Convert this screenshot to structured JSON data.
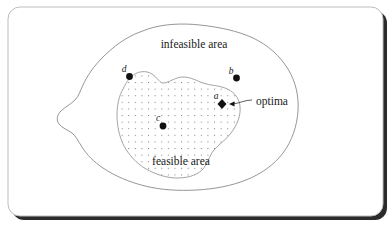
{
  "figure": {
    "background_color": "#ffffff",
    "frame": {
      "name": "rounded-card-frame",
      "border_color": "#bdbdbd",
      "shadow_color": "#2b2b2b"
    },
    "regions": [
      {
        "id": "infeasible",
        "label": "infeasible area",
        "label_x": 194,
        "label_y": 48,
        "fill": "#ffffff",
        "stroke": "#8a8a8a"
      },
      {
        "id": "feasible",
        "label": "feasible area",
        "label_x": 181,
        "label_y": 165,
        "fill": "dot-grid",
        "stroke": "#9a9a9a",
        "dot_color": "#777777",
        "dot_spacing": 6.6
      }
    ],
    "points": [
      {
        "id": "d",
        "label": "d",
        "x": 129.5,
        "y": 76.5,
        "marker": "circle",
        "label_x": 124,
        "label_y": 72
      },
      {
        "id": "b",
        "label": "b",
        "x": 236.5,
        "y": 78.0,
        "marker": "circle",
        "label_x": 231,
        "label_y": 74
      },
      {
        "id": "c",
        "label": "c",
        "x": 163.0,
        "y": 126.0,
        "marker": "circle",
        "label_x": 158,
        "label_y": 121
      },
      {
        "id": "a",
        "label": "a",
        "x": 222.0,
        "y": 104.0,
        "marker": "diamond",
        "label_x": 216,
        "label_y": 99
      }
    ],
    "callouts": [
      {
        "id": "optima",
        "label": "optima",
        "label_x": 256,
        "label_y": 105,
        "arrow_from_x": 252,
        "arrow_from_y": 101,
        "arrow_to_x": 229,
        "arrow_to_y": 104
      }
    ]
  }
}
